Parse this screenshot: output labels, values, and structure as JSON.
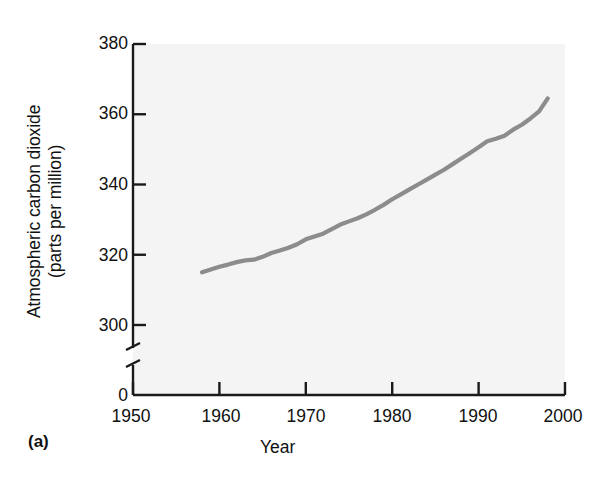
{
  "figure": {
    "panel_label": "(a)",
    "axis_color": "#1a1a1a",
    "line_color": "#8c8c8c",
    "plot_background": "#f4f4f4"
  },
  "chart_data": {
    "type": "line",
    "title": "",
    "subtitle": "",
    "xlabel": "Year",
    "ylabel": "Atmospheric carbon dioxide (parts per million)",
    "ylabel_line1": "Atmospheric carbon dioxide",
    "ylabel_line2": "(parts per million)",
    "xlim": [
      1950,
      2000
    ],
    "ylim": [
      290,
      380
    ],
    "y_axis_break": true,
    "y_zero_label": "0",
    "grid": false,
    "legend": "none",
    "xticks": [
      1950,
      1960,
      1970,
      1980,
      1990,
      2000
    ],
    "xtick_labels": [
      "1950",
      "1960",
      "1970",
      "1980",
      "1990",
      "2000"
    ],
    "yticks": [
      300,
      320,
      340,
      360,
      380
    ],
    "ytick_labels": [
      "300",
      "320",
      "340",
      "360",
      "380"
    ],
    "series": [
      {
        "name": "Atmospheric CO2 (Mauna Loa)",
        "x": [
          1958,
          1959,
          1960,
          1961,
          1962,
          1963,
          1964,
          1965,
          1966,
          1967,
          1968,
          1969,
          1970,
          1971,
          1972,
          1973,
          1974,
          1975,
          1976,
          1977,
          1978,
          1979,
          1980,
          1981,
          1982,
          1983,
          1984,
          1985,
          1986,
          1987,
          1988,
          1989,
          1990,
          1991,
          1992,
          1993,
          1994,
          1995,
          1996,
          1997,
          1998
        ],
        "values": [
          315.0,
          315.8,
          316.6,
          317.2,
          317.9,
          318.4,
          318.6,
          319.4,
          320.5,
          321.2,
          322.0,
          323.0,
          324.4,
          325.2,
          326.0,
          327.3,
          328.6,
          329.5,
          330.4,
          331.5,
          332.8,
          334.2,
          335.8,
          337.2,
          338.6,
          340.0,
          341.4,
          342.8,
          344.2,
          345.8,
          347.4,
          349.0,
          350.6,
          352.3,
          353.0,
          353.9,
          355.6,
          357.0,
          358.8,
          360.8,
          364.5
        ]
      }
    ]
  }
}
